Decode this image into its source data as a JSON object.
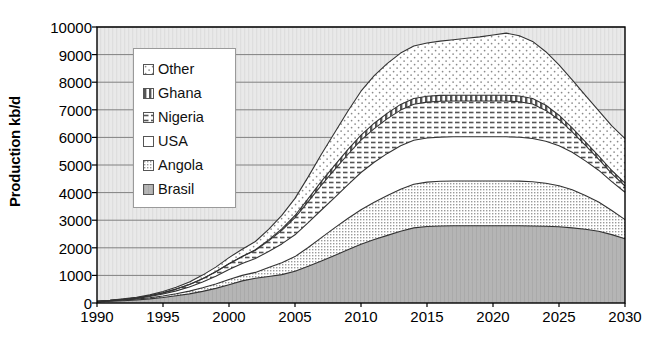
{
  "chart_data": {
    "type": "area",
    "stacked": true,
    "title": "",
    "subtitle": "",
    "xlabel": "",
    "ylabel": "Production kb/d",
    "xlim": [
      1990,
      2030
    ],
    "ylim": [
      0,
      10000
    ],
    "ytick_interval": 1000,
    "xtick_interval": 5,
    "grid": "horizontal",
    "legend_position": "inside-upper-left",
    "x": [
      1990,
      1991,
      1992,
      1993,
      1994,
      1995,
      1996,
      1997,
      1998,
      1999,
      2000,
      2001,
      2002,
      2003,
      2004,
      2005,
      2006,
      2007,
      2008,
      2009,
      2010,
      2011,
      2012,
      2013,
      2014,
      2015,
      2016,
      2017,
      2018,
      2019,
      2020,
      2021,
      2022,
      2023,
      2024,
      2025,
      2026,
      2027,
      2028,
      2029,
      2030
    ],
    "xticks": [
      1990,
      1995,
      2000,
      2005,
      2010,
      2015,
      2020,
      2025,
      2030
    ],
    "xticklabels": [
      "1990",
      "1995",
      "2000",
      "2005",
      "2010",
      "2015",
      "2020",
      "2025",
      "2030"
    ],
    "yticks": [
      0,
      1000,
      2000,
      3000,
      4000,
      5000,
      6000,
      7000,
      8000,
      9000,
      10000
    ],
    "yticklabels": [
      "0",
      "1000",
      "2000",
      "3000",
      "4000",
      "5000",
      "6000",
      "7000",
      "8000",
      "9000",
      "10000"
    ],
    "series": [
      {
        "name": "Brasil",
        "pattern": "solid-gray",
        "color": "#b5b5b5",
        "values": [
          40,
          60,
          85,
          110,
          150,
          200,
          260,
          330,
          420,
          530,
          660,
          800,
          900,
          960,
          1030,
          1150,
          1330,
          1520,
          1720,
          1930,
          2130,
          2300,
          2450,
          2600,
          2720,
          2770,
          2790,
          2800,
          2800,
          2800,
          2800,
          2800,
          2800,
          2790,
          2780,
          2760,
          2720,
          2670,
          2600,
          2480,
          2330
        ]
      },
      {
        "name": "Angola",
        "pattern": "fine-dots",
        "color": "#e2e2e2",
        "values": [
          10,
          15,
          22,
          30,
          40,
          55,
          75,
          100,
          130,
          160,
          190,
          200,
          210,
          330,
          430,
          530,
          680,
          850,
          1000,
          1130,
          1250,
          1350,
          1440,
          1520,
          1580,
          1610,
          1620,
          1620,
          1620,
          1620,
          1620,
          1620,
          1615,
          1600,
          1560,
          1490,
          1380,
          1230,
          1060,
          870,
          690
        ]
      },
      {
        "name": "USA",
        "pattern": "blank-white",
        "color": "#ffffff",
        "values": [
          5,
          10,
          18,
          28,
          45,
          70,
          105,
          150,
          210,
          280,
          360,
          430,
          500,
          580,
          680,
          790,
          900,
          1000,
          1100,
          1220,
          1350,
          1450,
          1530,
          1580,
          1600,
          1600,
          1600,
          1600,
          1600,
          1600,
          1600,
          1600,
          1590,
          1570,
          1520,
          1450,
          1360,
          1250,
          1150,
          1050,
          990
        ]
      },
      {
        "name": "Nigeria",
        "pattern": "horizontal-dash",
        "color": "#ededed",
        "values": [
          5,
          8,
          12,
          18,
          28,
          42,
          62,
          88,
          120,
          160,
          210,
          250,
          300,
          380,
          490,
          620,
          760,
          900,
          1010,
          1100,
          1170,
          1220,
          1260,
          1290,
          1300,
          1300,
          1300,
          1300,
          1300,
          1300,
          1300,
          1300,
          1290,
          1250,
          1120,
          940,
          740,
          560,
          400,
          290,
          230
        ]
      },
      {
        "name": "Ghana",
        "pattern": "vertical-stripe",
        "color": "#d0d0d0",
        "values": [
          0,
          0,
          0,
          0,
          0,
          0,
          0,
          0,
          0,
          0,
          5,
          10,
          20,
          35,
          55,
          80,
          110,
          140,
          160,
          175,
          185,
          195,
          200,
          205,
          210,
          210,
          210,
          210,
          210,
          210,
          210,
          210,
          205,
          200,
          185,
          165,
          145,
          130,
          120,
          110,
          105
        ]
      },
      {
        "name": "Other",
        "pattern": "sparse-dots",
        "color": "#f2f2f2",
        "values": [
          5,
          8,
          13,
          20,
          32,
          48,
          70,
          96,
          130,
          170,
          220,
          260,
          300,
          380,
          490,
          620,
          790,
          980,
          1180,
          1390,
          1590,
          1720,
          1800,
          1860,
          1900,
          1930,
          1970,
          2010,
          2060,
          2110,
          2180,
          2250,
          2180,
          2070,
          1940,
          1820,
          1740,
          1680,
          1640,
          1620,
          1610
        ]
      }
    ],
    "total_peak_value": 9400,
    "total_peak_year": 2021,
    "total_end_value": 5960
  },
  "legend": {
    "items": [
      {
        "label": "Other",
        "swatch": "sparse-dots-swatch"
      },
      {
        "label": "Ghana",
        "swatch": "vertical-stripe-swatch"
      },
      {
        "label": "Nigeria",
        "swatch": "horizontal-dash-swatch"
      },
      {
        "label": "USA",
        "swatch": "blank-white-swatch"
      },
      {
        "label": "Angola",
        "swatch": "fine-dots-swatch"
      },
      {
        "label": "Brasil",
        "swatch": "solid-gray-swatch"
      }
    ]
  },
  "colors": {
    "plot_background": "#e8e8e8",
    "grid_line": "#808080",
    "axis_line": "#000000",
    "series_outline": "#333333"
  }
}
